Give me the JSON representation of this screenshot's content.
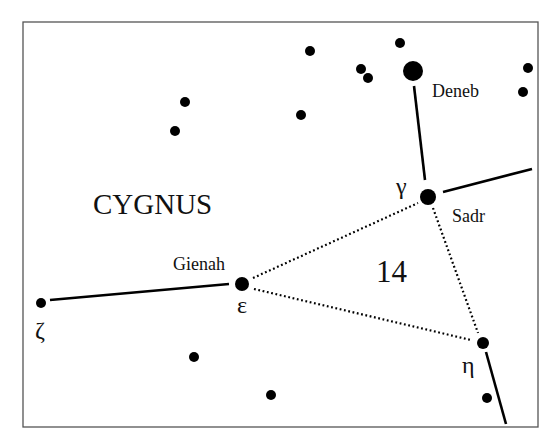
{
  "diagram": {
    "title": "CYGNUS",
    "area_number": "14",
    "frame": {
      "x": 23,
      "y": 22,
      "width": 515,
      "height": 405
    },
    "stars": [
      {
        "name": "deneb",
        "x": 413,
        "y": 71,
        "r": 10
      },
      {
        "name": "sadr-gamma",
        "x": 428,
        "y": 197,
        "r": 8
      },
      {
        "name": "gienah-epsilon",
        "x": 242,
        "y": 284,
        "r": 7
      },
      {
        "name": "zeta",
        "x": 41,
        "y": 303,
        "r": 5
      },
      {
        "name": "eta",
        "x": 483,
        "y": 343,
        "r": 6
      },
      {
        "name": "field-star-1",
        "x": 310,
        "y": 51,
        "r": 5
      },
      {
        "name": "field-star-2",
        "x": 400,
        "y": 43,
        "r": 5
      },
      {
        "name": "field-star-3",
        "x": 361,
        "y": 69,
        "r": 5
      },
      {
        "name": "field-star-4",
        "x": 368,
        "y": 78,
        "r": 5
      },
      {
        "name": "field-star-5",
        "x": 528,
        "y": 68,
        "r": 5
      },
      {
        "name": "field-star-6",
        "x": 523,
        "y": 92,
        "r": 5
      },
      {
        "name": "field-star-7",
        "x": 185,
        "y": 102,
        "r": 5
      },
      {
        "name": "field-star-8",
        "x": 175,
        "y": 131,
        "r": 5
      },
      {
        "name": "field-star-9",
        "x": 301,
        "y": 115,
        "r": 5
      },
      {
        "name": "field-star-10",
        "x": 194,
        "y": 357,
        "r": 5
      },
      {
        "name": "field-star-11",
        "x": 271,
        "y": 395,
        "r": 5
      },
      {
        "name": "field-star-12",
        "x": 487,
        "y": 398,
        "r": 5
      }
    ],
    "solid_lines": [
      {
        "name": "deneb-to-sadr",
        "x1": 414,
        "y1": 86,
        "x2": 425,
        "y2": 180
      },
      {
        "name": "sadr-to-east",
        "x1": 443,
        "y1": 192,
        "x2": 532,
        "y2": 169
      },
      {
        "name": "zeta-to-gienah",
        "x1": 50,
        "y1": 300,
        "x2": 229,
        "y2": 284
      },
      {
        "name": "eta-to-south",
        "x1": 486,
        "y1": 352,
        "x2": 506,
        "y2": 424
      }
    ],
    "dotted_lines": [
      {
        "name": "gienah-to-sadr",
        "x1": 253,
        "y1": 278,
        "x2": 418,
        "y2": 203
      },
      {
        "name": "gienah-to-eta",
        "x1": 254,
        "y1": 289,
        "x2": 471,
        "y2": 340
      },
      {
        "name": "sadr-to-eta",
        "x1": 433,
        "y1": 208,
        "x2": 478,
        "y2": 333
      }
    ],
    "labels": {
      "title": {
        "text": "CYGNUS",
        "x": 93,
        "y": 214
      },
      "area": {
        "text": "14",
        "x": 376,
        "y": 282
      },
      "deneb": {
        "text": "Deneb",
        "x": 432,
        "y": 97
      },
      "sadr": {
        "text": "Sadr",
        "x": 452,
        "y": 222
      },
      "gienah": {
        "text": "Gienah",
        "x": 173,
        "y": 270
      },
      "gamma": {
        "text": "γ",
        "x": 396,
        "y": 194
      },
      "epsilon": {
        "text": "ε",
        "x": 237,
        "y": 313
      },
      "zeta": {
        "text": "ζ",
        "x": 35,
        "y": 338
      },
      "eta": {
        "text": "η",
        "x": 462,
        "y": 373
      }
    }
  }
}
